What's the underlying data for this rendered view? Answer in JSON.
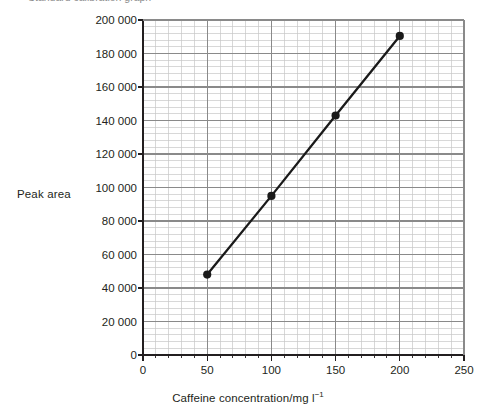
{
  "caption": {
    "text": "Standard calibration graph"
  },
  "chart_data": {
    "type": "line",
    "title": "",
    "subtitle": "",
    "xlabel": "Caffeine concentration/mg l",
    "xlabel_superscript": "−1",
    "ylabel": "Peak area",
    "xlim": [
      0,
      250
    ],
    "ylim": [
      0,
      200000
    ],
    "x_major_step": 50,
    "x_minor_step": 10,
    "y_major_step": 20000,
    "y_minor_step": 4000,
    "y_tickmark_step": 40000,
    "grid": "minor-and-major",
    "legend": "none",
    "xticks": [
      "0",
      "50",
      "100",
      "150",
      "200",
      "250"
    ],
    "xtick_values": [
      0,
      50,
      100,
      150,
      200,
      250
    ],
    "yticks": [
      "0",
      "20 000",
      "40 000",
      "60 000",
      "80 000",
      "100 000",
      "120 000",
      "140 000",
      "160 000",
      "180 000",
      "200 000"
    ],
    "ytick_values": [
      0,
      20000,
      40000,
      60000,
      80000,
      100000,
      120000,
      140000,
      160000,
      180000,
      200000
    ],
    "series": [
      {
        "name": "Caffeine standards",
        "marker": "filled-circle",
        "color": "#1a1a1a",
        "x": [
          50,
          100,
          150,
          200
        ],
        "values": [
          48000,
          95000,
          143000,
          190500
        ]
      }
    ]
  },
  "style": {
    "axis_color": "#231f20",
    "grid_minor_color": "#c8c8c8",
    "grid_major_color": "#8a8a8a",
    "data_color": "#1a1a1a",
    "text_color": "#231f20"
  }
}
